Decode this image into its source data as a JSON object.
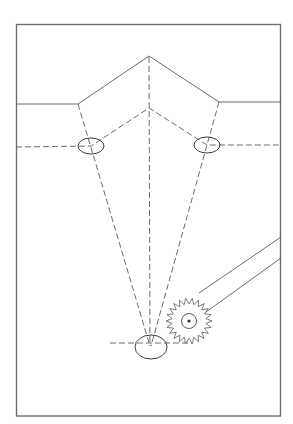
{
  "figure": {
    "description": "Pattern drafting diagram: a pentagon-shaped yoke outline with dashed construction lines converging from two shoulder ellipses to a bottom ellipse, and a tracing wheel with handle.",
    "labels": [],
    "elements": {
      "frame": "page-border",
      "outer_outline": "solid-yoke-line",
      "inner_outline": "dashed-seam-line",
      "center_line": "dashed-center-line",
      "guide_lines": "dashed-converging-lines",
      "markers": [
        "left-shoulder-ellipse",
        "right-shoulder-ellipse",
        "bottom-point-ellipse"
      ],
      "tool": "tracing-wheel"
    },
    "colors": {
      "line": "#5a5a5a",
      "frame": "#6e6e6e",
      "background": "#ffffff"
    }
  }
}
